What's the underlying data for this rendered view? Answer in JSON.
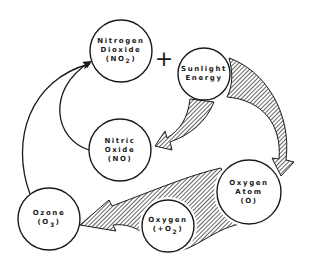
{
  "diagram": {
    "type": "cycle",
    "title": "",
    "nodes": [
      {
        "id": "no2",
        "line1": "Nitrogen",
        "line2": "Dioxide",
        "line3": "(NO",
        "sub": "2",
        "line3_end": ")"
      },
      {
        "id": "sunlight",
        "line1": "Sunlight",
        "line2": "Energy"
      },
      {
        "id": "no",
        "line1": "Nitric",
        "line2": "Oxide",
        "line3": "(NO)"
      },
      {
        "id": "o_atom",
        "line1": "Oxygen",
        "line2": "Atom",
        "line3": "(O)"
      },
      {
        "id": "o2",
        "line1": "Oxygen",
        "line2": "(+O",
        "sub": "2",
        "line2_end": ")"
      },
      {
        "id": "ozone",
        "line1": "Ozone",
        "line2": "(O",
        "sub": "3",
        "line2_end": ")"
      }
    ],
    "operator": "+",
    "edges": [
      {
        "from": "sunlight",
        "to": "no",
        "style": "hatched-arrow"
      },
      {
        "from": "sunlight",
        "to": "o_atom",
        "style": "hatched-arrow"
      },
      {
        "from": "o_atom",
        "to": "ozone",
        "via": "o2",
        "style": "hatched-arrow"
      },
      {
        "from": "no",
        "to": "no2",
        "style": "line-arrow"
      },
      {
        "from": "ozone",
        "to": "no2",
        "style": "line-arrow"
      }
    ]
  }
}
